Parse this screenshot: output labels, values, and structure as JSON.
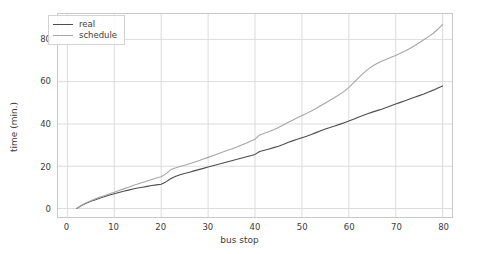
{
  "chart_data": {
    "type": "line",
    "title": "",
    "xlabel": "bus stop",
    "ylabel": "time (min.)",
    "xlim": [
      -2,
      82
    ],
    "ylim": [
      -4,
      92
    ],
    "xticks": [
      0,
      10,
      20,
      30,
      40,
      50,
      60,
      70,
      80
    ],
    "yticks": [
      0,
      20,
      40,
      60,
      80
    ],
    "grid": true,
    "legend_position": "upper left",
    "colors": {
      "real": "#4d4d4d",
      "schedule": "#a6a6a6",
      "grid": "#dcdcdc",
      "frame": "#c8c8c8",
      "text": "#3c3c3c",
      "background": "#ffffff"
    },
    "series": [
      {
        "name": "real",
        "x": [
          2,
          3,
          4,
          5,
          6,
          7,
          8,
          9,
          10,
          11,
          12,
          13,
          14,
          15,
          16,
          17,
          18,
          19,
          20,
          21,
          22,
          23,
          24,
          25,
          26,
          27,
          28,
          29,
          30,
          31,
          32,
          33,
          34,
          35,
          36,
          37,
          38,
          39,
          40,
          41,
          42,
          43,
          44,
          45,
          46,
          47,
          48,
          49,
          50,
          51,
          52,
          53,
          54,
          55,
          56,
          57,
          58,
          59,
          60,
          61,
          62,
          63,
          64,
          65,
          66,
          67,
          68,
          69,
          70,
          71,
          72,
          73,
          74,
          75,
          76,
          77,
          78,
          79,
          80
        ],
        "y": [
          0.0,
          1.4,
          2.5,
          3.4,
          4.2,
          5.0,
          5.7,
          6.4,
          7.0,
          7.6,
          8.2,
          8.7,
          9.2,
          9.7,
          10.1,
          10.5,
          10.9,
          11.2,
          11.5,
          12.6,
          14.1,
          15.2,
          16.0,
          16.6,
          17.2,
          17.8,
          18.4,
          19.0,
          19.6,
          20.2,
          20.8,
          21.4,
          22.0,
          22.6,
          23.2,
          23.8,
          24.4,
          25.0,
          25.6,
          27.0,
          27.6,
          28.2,
          28.8,
          29.5,
          30.3,
          31.2,
          32.0,
          32.8,
          33.5,
          34.2,
          35.0,
          35.9,
          36.8,
          37.6,
          38.3,
          39.0,
          39.8,
          40.6,
          41.4,
          42.2,
          43.2,
          44.0,
          44.8,
          45.6,
          46.3,
          47.0,
          47.8,
          48.6,
          49.4,
          50.2,
          51.0,
          51.8,
          52.6,
          53.4,
          54.2,
          55.1,
          56.0,
          57.0,
          58.0
        ]
      },
      {
        "name": "schedule",
        "x": [
          2,
          3,
          4,
          5,
          6,
          7,
          8,
          9,
          10,
          11,
          12,
          13,
          14,
          15,
          16,
          17,
          18,
          19,
          20,
          21,
          22,
          23,
          24,
          25,
          26,
          27,
          28,
          29,
          30,
          31,
          32,
          33,
          34,
          35,
          36,
          37,
          38,
          39,
          40,
          41,
          42,
          43,
          44,
          45,
          46,
          47,
          48,
          49,
          50,
          51,
          52,
          53,
          54,
          55,
          56,
          57,
          58,
          59,
          60,
          61,
          62,
          63,
          64,
          65,
          66,
          67,
          68,
          69,
          70,
          71,
          72,
          73,
          74,
          75,
          76,
          77,
          78,
          79,
          80
        ],
        "y": [
          0.0,
          1.5,
          2.7,
          3.7,
          4.6,
          5.4,
          6.2,
          7.0,
          7.7,
          8.5,
          9.3,
          10.1,
          10.9,
          11.6,
          12.3,
          13.0,
          13.7,
          14.4,
          15.0,
          16.4,
          18.3,
          19.2,
          19.9,
          20.5,
          21.2,
          21.9,
          22.6,
          23.4,
          24.2,
          25.0,
          25.8,
          26.6,
          27.4,
          28.2,
          29.0,
          29.9,
          30.8,
          31.8,
          32.8,
          34.8,
          35.6,
          36.4,
          37.3,
          38.3,
          39.5,
          40.7,
          41.8,
          42.9,
          44.0,
          45.0,
          46.1,
          47.3,
          48.6,
          49.9,
          51.2,
          52.5,
          53.9,
          55.4,
          57.3,
          59.4,
          61.7,
          63.8,
          65.7,
          67.3,
          68.6,
          69.7,
          70.6,
          71.5,
          72.4,
          73.4,
          74.5,
          75.7,
          77.0,
          78.4,
          79.8,
          81.3,
          82.9,
          84.8,
          87.0
        ]
      }
    ]
  },
  "legend": {
    "items": [
      {
        "label": "real"
      },
      {
        "label": "schedule"
      }
    ]
  }
}
